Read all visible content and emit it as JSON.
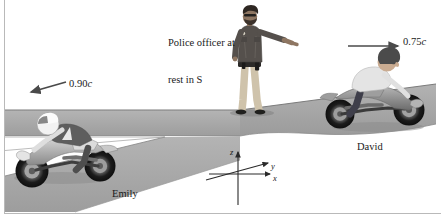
{
  "figure": {
    "background_color": "#ffffff",
    "border_color": "#b9b9b9",
    "road_color": "#a8a8a8",
    "road_edge_color": "#6e6e6e",
    "arrow_color": "#4a4a4a",
    "text_color": "#1a1a1a"
  },
  "labels": {
    "officer_line1": "Police officer at",
    "officer_line2": "rest in S",
    "emily": "Emily",
    "david": "David"
  },
  "velocities": {
    "left": {
      "value": "0.90",
      "symbol": "c",
      "direction": "left",
      "rider": "Emily"
    },
    "right": {
      "value": "0.75",
      "symbol": "c",
      "direction": "right",
      "rider": "David"
    }
  },
  "axes": {
    "z": "z",
    "y": "y",
    "x": "x"
  },
  "figures": {
    "officer": {
      "name": "police-officer",
      "shirt_color": "#55504c",
      "pants_color": "#cfc3ab",
      "skin_color": "#8e7662",
      "pose": "standing, right arm extended pointing right"
    },
    "emily": {
      "name": "emily-motorcyclist",
      "facing": "left",
      "helmet": "white",
      "bike_color": "#cfcfcf",
      "suit_color": "#5e5e5e"
    },
    "david": {
      "name": "david-motorcyclist",
      "facing": "right",
      "helmet": "none",
      "hair_color": "#4b4b4b",
      "shirt_color": "#e2e2e2",
      "bike_color": "#8e8e8e"
    }
  }
}
